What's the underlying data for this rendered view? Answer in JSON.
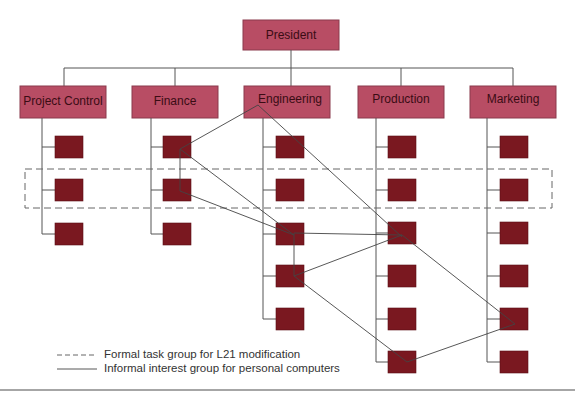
{
  "org_chart": {
    "top": {
      "label": "President"
    },
    "departments": [
      {
        "label": "Project Control",
        "subordinates": 3
      },
      {
        "label": "Finance",
        "subordinates": 3
      },
      {
        "label": "Engineering",
        "subordinates": 5
      },
      {
        "label": "Production",
        "subordinates": 6
      },
      {
        "label": "Marketing",
        "subordinates": 6
      }
    ],
    "colors": {
      "unit_box": "#b84d64",
      "subordinate_box": "#7a1820",
      "lines": "#555555"
    }
  },
  "groups": {
    "formal": {
      "description": "Formal task group for L21 modification",
      "style": "dashed",
      "members": [
        "Project Control #2",
        "Finance #2",
        "Engineering #2",
        "Production #2",
        "Marketing #2"
      ]
    },
    "informal": {
      "description": "Informal interest group for personal computers",
      "style": "solid",
      "members": [
        "Engineering (head)",
        "Finance #1",
        "Finance #2",
        "Engineering #3",
        "Engineering #4",
        "Production #3",
        "Production #6",
        "Marketing #5"
      ]
    }
  },
  "legend": {
    "items": [
      {
        "symbol": "dashed-line",
        "label": "Formal task group for L21 modification"
      },
      {
        "symbol": "solid-line",
        "label": "Informal interest group for personal computers"
      }
    ]
  }
}
